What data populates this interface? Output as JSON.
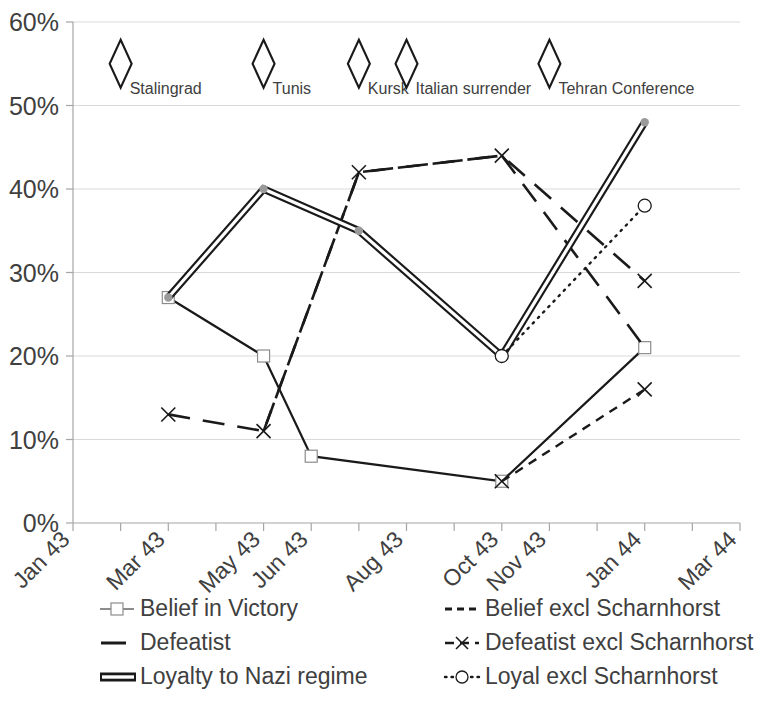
{
  "chart_data": {
    "type": "line",
    "title": "",
    "subtitle": "",
    "xlabel": "",
    "ylabel": "",
    "grid": true,
    "legend_position": "bottom",
    "ylim": [
      0,
      60
    ],
    "ytick_labels": [
      "0%",
      "10%",
      "20%",
      "30%",
      "40%",
      "50%",
      "60%"
    ],
    "ytick_values": [
      0,
      10,
      20,
      30,
      40,
      50,
      60
    ],
    "xtick_labels": [
      "Jan 43",
      "Mar 43",
      "May 43",
      "Jun 43",
      "Aug 43",
      "Oct 43",
      "Nov 43",
      "Jan 44",
      "Mar 44"
    ],
    "x_categories": [
      "Jan 43",
      "Feb 43",
      "Mar 43",
      "Apr 43",
      "May 43",
      "Jun 43",
      "Jul 43",
      "Aug 43",
      "Sep 43",
      "Oct 43",
      "Nov 43",
      "Dec 43",
      "Jan 44",
      "Feb 44",
      "Mar 44"
    ],
    "series": [
      {
        "name": "Belief in Victory",
        "style": "solid-square",
        "points": [
          {
            "x": "Mar 43",
            "y": 27
          },
          {
            "x": "May 43",
            "y": 20
          },
          {
            "x": "Jun 43",
            "y": 8
          },
          {
            "x": "Oct 43",
            "y": 5
          },
          {
            "x": "Jan 44",
            "y": 21
          }
        ]
      },
      {
        "name": "Belief excl Scharnhorst",
        "style": "short-dash",
        "points": [
          {
            "x": "Oct 43",
            "y": 5
          },
          {
            "x": "Jan 44",
            "y": 16
          }
        ]
      },
      {
        "name": "Defeatist",
        "style": "long-dash",
        "points": [
          {
            "x": "May 43",
            "y": 11
          },
          {
            "x": "Jul 43",
            "y": 42
          },
          {
            "x": "Oct 43",
            "y": 44
          },
          {
            "x": "Jan 44",
            "y": 21
          }
        ]
      },
      {
        "name": "Defeatist excl Scharnhorst",
        "style": "long-dash-x",
        "points": [
          {
            "x": "Mar 43",
            "y": 13
          },
          {
            "x": "May 43",
            "y": 11
          },
          {
            "x": "Jul 43",
            "y": 42
          },
          {
            "x": "Oct 43",
            "y": 44
          },
          {
            "x": "Jan 44",
            "y": 29
          }
        ]
      },
      {
        "name": "Loyalty to Nazi regime",
        "style": "double-line",
        "points": [
          {
            "x": "Mar 43",
            "y": 27
          },
          {
            "x": "May 43",
            "y": 40
          },
          {
            "x": "Jul 43",
            "y": 35
          },
          {
            "x": "Oct 43",
            "y": 20
          },
          {
            "x": "Jan 44",
            "y": 48
          }
        ]
      },
      {
        "name": "Loyal excl Scharnhorst",
        "style": "dotted-circle",
        "points": [
          {
            "x": "Oct 43",
            "y": 20
          },
          {
            "x": "Jan 44",
            "y": 38
          }
        ]
      }
    ],
    "annotations": [
      {
        "label": "Stalingrad",
        "x": "Feb 43",
        "y": 55,
        "marker": "diamond"
      },
      {
        "label": "Tunis",
        "x": "May 43",
        "y": 55,
        "marker": "diamond"
      },
      {
        "label": "Kursk",
        "x": "Jul 43",
        "y": 55,
        "marker": "diamond"
      },
      {
        "label": "Italian surrender",
        "x": "Aug 43",
        "y": 55,
        "marker": "diamond"
      },
      {
        "label": "Tehran Conference",
        "x": "Nov 43",
        "y": 55,
        "marker": "diamond"
      }
    ]
  },
  "legend": {
    "entries": [
      {
        "label": "Belief in Victory",
        "marker": "line-square-light"
      },
      {
        "label": "Belief excl Scharnhorst",
        "marker": "short-dash"
      },
      {
        "label": "Defeatist",
        "marker": "solid-short-line"
      },
      {
        "label": "Defeatist excl Scharnhorst",
        "marker": "dash-x-dash"
      },
      {
        "label": "Loyalty to Nazi regime",
        "marker": "double-bar"
      },
      {
        "label": "Loyal excl Scharnhorst",
        "marker": "dot-circle-dot"
      }
    ]
  },
  "colors": {
    "series": "#1a1a1a",
    "grid": "#d9d9d9",
    "axis": "#a6a6a6",
    "text": "#404040",
    "background": "#ffffff"
  }
}
